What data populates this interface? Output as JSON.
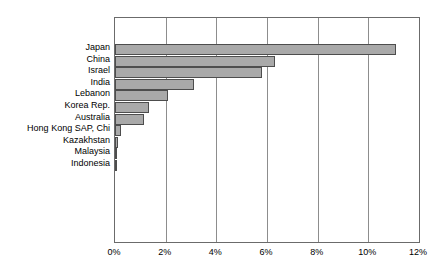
{
  "chart_data": {
    "type": "bar",
    "orientation": "horizontal",
    "title": "",
    "subtitle": "",
    "xlabel": "",
    "ylabel": "",
    "categories": [
      "Japan",
      "China",
      "Israel",
      "India",
      "Lebanon",
      "Korea Rep.",
      "Australia",
      "Hong Kong SAP, Chi",
      "Kazakhstan",
      "Malaysia",
      "Indonesia"
    ],
    "values": [
      11.1,
      6.3,
      5.8,
      3.1,
      2.1,
      1.35,
      1.15,
      0.25,
      0.1,
      0.05,
      0.05
    ],
    "value_suffix": "%",
    "xlim": [
      0,
      12
    ],
    "xticks": [
      0,
      2,
      4,
      6,
      8,
      10,
      12
    ],
    "xtick_labels": [
      "0%",
      "2%",
      "4%",
      "6%",
      "8%",
      "10%",
      "12%"
    ],
    "grid": "vertical",
    "legend": "none",
    "bar_color": "#a9a9a9",
    "bar_edge_color": "#4d4d4d",
    "plot_border_color": "#6b6b6b",
    "gridline_color": "#8d8d8d",
    "background_color": "#ffffff",
    "text_color": "#000000"
  }
}
